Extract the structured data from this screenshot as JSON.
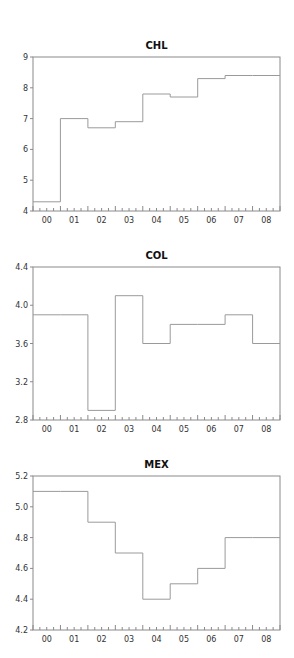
{
  "chart_data": [
    {
      "type": "line",
      "style": "step",
      "title": "CHL",
      "xlabel": "",
      "ylabel": "",
      "categories": [
        "00",
        "01",
        "02",
        "03",
        "04",
        "05",
        "06",
        "07",
        "08"
      ],
      "values": [
        4.3,
        7.0,
        6.7,
        6.9,
        7.8,
        7.7,
        8.3,
        8.4,
        8.4
      ],
      "ylim": [
        4,
        9
      ],
      "yticks": [
        "4",
        "5",
        "6",
        "7",
        "8",
        "9"
      ],
      "ytick_values": [
        4,
        5,
        6,
        7,
        8,
        9
      ],
      "grid": false,
      "legend": null,
      "line_color": "#9a9a9a"
    },
    {
      "type": "line",
      "style": "step",
      "title": "COL",
      "xlabel": "",
      "ylabel": "",
      "categories": [
        "00",
        "01",
        "02",
        "03",
        "04",
        "05",
        "06",
        "07",
        "08"
      ],
      "values": [
        3.9,
        3.9,
        2.9,
        4.1,
        3.6,
        3.8,
        3.8,
        3.9,
        3.6
      ],
      "ylim": [
        2.8,
        4.4
      ],
      "yticks": [
        "2.8",
        "3.2",
        "3.6",
        "4.0",
        "4.4"
      ],
      "ytick_values": [
        2.8,
        3.2,
        3.6,
        4.0,
        4.4
      ],
      "grid": false,
      "legend": null,
      "line_color": "#9a9a9a"
    },
    {
      "type": "line",
      "style": "step",
      "title": "MEX",
      "xlabel": "",
      "ylabel": "",
      "categories": [
        "00",
        "01",
        "02",
        "03",
        "04",
        "05",
        "06",
        "07",
        "08"
      ],
      "values": [
        5.1,
        5.1,
        4.9,
        4.7,
        4.4,
        4.5,
        4.6,
        4.8,
        4.8
      ],
      "ylim": [
        4.2,
        5.2
      ],
      "yticks": [
        "4.2",
        "4.4",
        "4.6",
        "4.8",
        "5.0",
        "5.2"
      ],
      "ytick_values": [
        4.2,
        4.4,
        4.6,
        4.8,
        5.0,
        5.2
      ],
      "grid": false,
      "legend": null,
      "line_color": "#9a9a9a"
    }
  ],
  "colors": {
    "frame": "#8a8a8a",
    "series": "#9a9a9a",
    "text": "#333333"
  }
}
